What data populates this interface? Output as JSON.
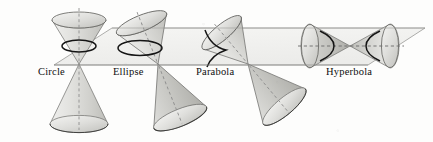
{
  "figure": {
    "background_color": "#fdfdfc",
    "ink_color": "#2b2b2b",
    "plane_fill": "#f1f1ef",
    "cone_fill_light": "#e9e9e7",
    "cone_fill_mid": "#d8d8d5",
    "cone_fill_dark": "#bfbfbb",
    "curve_color": "#1b1b1b",
    "axis_dash_color": "#8f8f8f"
  },
  "plane": {
    "name": "cutting-plane",
    "label": "horizontal cutting plane",
    "top_edge_y": 28,
    "bottom_edge_y": 65
  },
  "labels": [
    {
      "id": "circle",
      "text": "Circle",
      "x": 38,
      "y": 68
    },
    {
      "id": "ellipse",
      "text": "Ellipse",
      "x": 113,
      "y": 68
    },
    {
      "id": "parabola",
      "text": "Parabola",
      "x": 196,
      "y": 68
    },
    {
      "id": "hyperbola",
      "text": "Hyperbola",
      "x": 326,
      "y": 68
    }
  ],
  "conics": [
    {
      "id": "circle",
      "label": "Circle",
      "axis_orientation": "vertical",
      "axis_tilt_degrees": 0,
      "plane_relation": "plane perpendicular to the axis",
      "section_shape": "circle",
      "apex": {
        "x": 79,
        "y": 64
      },
      "nappes": 2
    },
    {
      "id": "ellipse",
      "label": "Ellipse",
      "axis_orientation": "tilted",
      "axis_tilt_degrees": 24,
      "plane_relation": "plane oblique to the axis, cutting one nappe",
      "section_shape": "ellipse",
      "apex": {
        "x": 158,
        "y": 64
      },
      "nappes": 2
    },
    {
      "id": "parabola",
      "label": "Parabola",
      "axis_orientation": "strongly tilted",
      "axis_tilt_degrees": 52,
      "plane_relation": "plane parallel to a generating line",
      "section_shape": "parabola",
      "apex": {
        "x": 248,
        "y": 64
      },
      "nappes": 2
    },
    {
      "id": "hyperbola",
      "label": "Hyperbola",
      "axis_orientation": "horizontal",
      "axis_tilt_degrees": 90,
      "plane_relation": "plane parallel to the axis, cutting both nappes",
      "section_shape": "hyperbola",
      "apex": {
        "x": 350,
        "y": 46
      },
      "nappes": 2
    }
  ]
}
